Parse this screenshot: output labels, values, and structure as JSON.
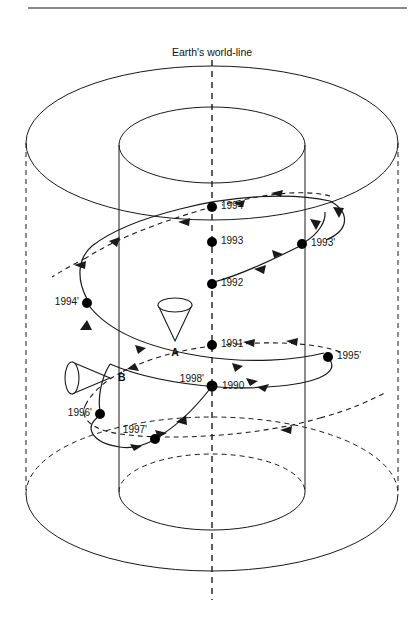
{
  "figure": {
    "kind": "spacetime-wormhole-diagram",
    "title": "Earth's world-line",
    "background": "#ffffff",
    "stroke": "#1a1a1a",
    "header_rule": {
      "x1": 28,
      "x2": 407,
      "y": 8,
      "color": "#808080"
    }
  },
  "axis": {
    "name": "earths-world-line",
    "label": "Earth's world-line",
    "label_x": 212,
    "label_y": 52,
    "x": 212,
    "y_top": 60,
    "y_bottom": 600,
    "style": "dashed"
  },
  "cylinder": {
    "left_wall_x": 120,
    "right_wall_x": 305,
    "top_ellipse": {
      "cx": 212,
      "cy": 145,
      "rx": 93,
      "ry": 38
    },
    "bottom_ellipse": {
      "cx": 212,
      "cy": 492,
      "rx": 93,
      "ry": 38
    }
  },
  "outer_disc": {
    "top_ellipse": {
      "cx": 212,
      "cy": 143,
      "rx": 186,
      "ry": 77
    },
    "bottom_ellipse": {
      "cx": 212,
      "cy": 494,
      "rx": 186,
      "ry": 77
    },
    "left_edge_x": 26,
    "right_edge_x": 399,
    "edge_style": "dashed"
  },
  "events": [
    {
      "name": "event-1994",
      "label": "1994",
      "x": 212,
      "y": 207,
      "side": "right"
    },
    {
      "name": "event-1993",
      "label": "1993",
      "x": 212,
      "y": 242,
      "side": "right"
    },
    {
      "name": "event-1992",
      "label": "1992",
      "x": 212,
      "y": 284,
      "side": "right"
    },
    {
      "name": "event-1991",
      "label": "1991",
      "x": 212,
      "y": 345,
      "side": "right"
    },
    {
      "name": "event-1990",
      "label": "1990",
      "x": 212,
      "y": 386,
      "side": "right"
    },
    {
      "name": "event-1993-prime",
      "label": "1993'",
      "x": 302,
      "y": 244,
      "side": "right"
    },
    {
      "name": "event-1995-prime",
      "label": "1995'",
      "x": 328,
      "y": 357,
      "side": "right"
    },
    {
      "name": "event-1994-prime",
      "label": "1994'",
      "x": 87,
      "y": 303,
      "side": "left"
    },
    {
      "name": "event-1996-prime",
      "label": "1996'",
      "x": 100,
      "y": 414,
      "side": "left"
    },
    {
      "name": "event-1997-prime",
      "label": "1997'",
      "x": 155,
      "y": 439,
      "side": "left"
    },
    {
      "name": "event-1998-prime",
      "label": "1998'",
      "x": 212,
      "y": 386,
      "side": "left"
    }
  ],
  "cones": [
    {
      "name": "light-cone-a",
      "label": "A",
      "apex_x": 175,
      "apex_y": 340,
      "mouth_cx": 175,
      "mouth_cy": 305,
      "rx": 17,
      "ry": 7,
      "orientation": "down",
      "label_x": 175,
      "label_y": 352
    },
    {
      "name": "light-cone-b",
      "label": "B",
      "apex_x": 110,
      "apex_y": 378,
      "mouth_cx": 72,
      "mouth_cy": 378,
      "rx": 7,
      "ry": 16,
      "orientation": "right",
      "label_x": 120,
      "label_y": 374
    }
  ],
  "worldlines": [
    {
      "name": "solid-traveller-world-line",
      "style": "solid",
      "description": "helical world-line through 1990,1998',1997',1996',1994',1992,1993',1994"
    },
    {
      "name": "dashed-traveller-world-line",
      "style": "dashed",
      "description": "helical world-line through 1990,1991,1995',1996',1997',1993,1994"
    }
  ]
}
